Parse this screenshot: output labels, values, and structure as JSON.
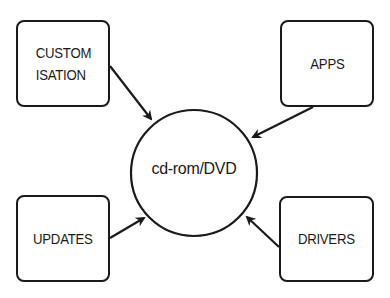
{
  "diagram": {
    "center": {
      "label": "cd-rom/DVD",
      "shape": "circle"
    },
    "nodes": [
      {
        "id": "customisation",
        "label": "CUSTOM\nISATION",
        "position": "top-left"
      },
      {
        "id": "apps",
        "label": "APPS",
        "position": "top-right"
      },
      {
        "id": "updates",
        "label": "UPDATES",
        "position": "bottom-left"
      },
      {
        "id": "drivers",
        "label": "DRIVERS",
        "position": "bottom-right"
      }
    ],
    "edges": [
      {
        "from": "customisation",
        "to": "cd-rom/DVD"
      },
      {
        "from": "apps",
        "to": "cd-rom/DVD"
      },
      {
        "from": "updates",
        "to": "cd-rom/DVD"
      },
      {
        "from": "drivers",
        "to": "cd-rom/DVD"
      }
    ],
    "colors": {
      "stroke": "#1a1a1a",
      "background": "#ffffff"
    }
  }
}
